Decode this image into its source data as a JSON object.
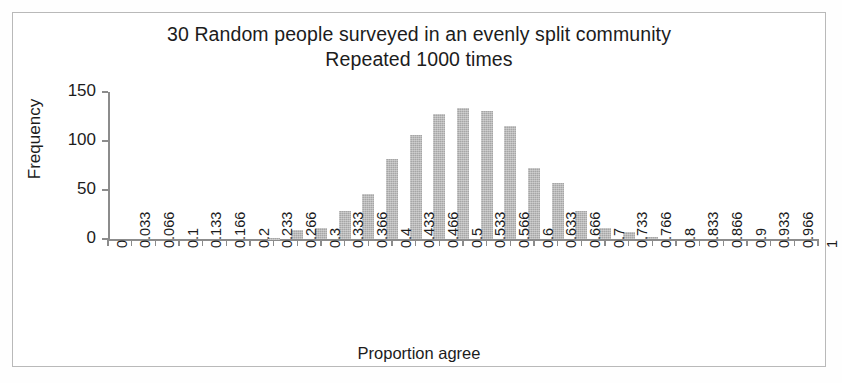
{
  "figure": {
    "title_line1": "30 Random people surveyed in an evenly split community",
    "title_line2": "Repeated 1000 times",
    "xtitle": "Proportion agree",
    "ytitle": "Frequency",
    "bar_color": "#a6a6a6",
    "axis_color": "#8c8c8c",
    "frame_color": "#b9b9b9",
    "background": "#ffffff"
  },
  "chart_data": {
    "type": "bar",
    "title": "30 Random people surveyed in an evenly split community Repeated 1000 times",
    "xlabel": "Proportion agree",
    "ylabel": "Frequency",
    "xlim": [
      0,
      1
    ],
    "ylim": [
      0,
      150
    ],
    "yticks": [
      0,
      50,
      100,
      150
    ],
    "grid": false,
    "legend": null,
    "categories": [
      "0",
      "0.033",
      "0.066",
      "0.1",
      "0.133",
      "0.166",
      "0.2",
      "0.233",
      "0.266",
      "0.3",
      "0.333",
      "0.366",
      "0.4",
      "0.433",
      "0.466",
      "0.5",
      "0.533",
      "0.566",
      "0.6",
      "0.633",
      "0.666",
      "0.7",
      "0.733",
      "0.766",
      "0.8",
      "0.833",
      "0.866",
      "0.9",
      "0.933",
      "0.966",
      "1"
    ],
    "values": [
      0,
      0,
      0,
      0,
      0,
      0,
      0,
      1,
      9,
      11,
      29,
      46,
      82,
      106,
      128,
      134,
      131,
      115,
      72,
      57,
      29,
      11,
      7,
      2,
      0,
      0,
      0,
      0,
      0,
      0,
      0
    ]
  },
  "ylabels": [
    "150",
    "100",
    "50",
    "0"
  ]
}
